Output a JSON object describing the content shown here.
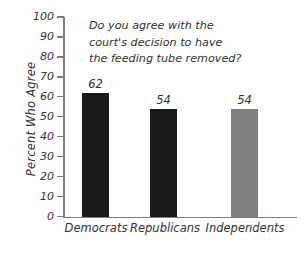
{
  "chart_data": {
    "type": "bar",
    "title": "Do you agree with the court's decision to have the feeding tube removed?",
    "title_lines": [
      "Do you agree with the",
      "court's decision to have",
      "the feeding tube removed?"
    ],
    "categories": [
      "Democrats",
      "Republicans",
      "Independents"
    ],
    "values": [
      62,
      54,
      54
    ],
    "data_labels": [
      "62",
      "54",
      "54"
    ],
    "xlabel": "",
    "ylabel": "Percent Who Agree",
    "ylim": [
      0,
      100
    ],
    "yticks": [
      100,
      90,
      80,
      70,
      60,
      50,
      40,
      30,
      20,
      10,
      0
    ],
    "ytick_labels": [
      "100",
      "90",
      "80",
      "70",
      "60",
      "50",
      "40",
      "30",
      "20",
      "10",
      "0"
    ],
    "grid": false,
    "legend": false,
    "bar_colors": [
      "#1a1a1a",
      "#1a1a1a",
      "#808080"
    ],
    "axis_color": "#7d7d7d",
    "text_color": "#333333",
    "background": "#ffffff"
  }
}
